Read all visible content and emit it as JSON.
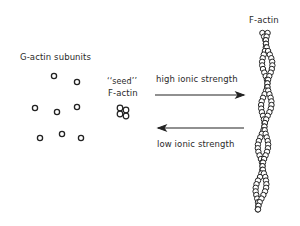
{
  "labels": {
    "g_actin": "G-actin subunits",
    "seed_line1": "‘‘seed’’",
    "seed_line2": "F-actin",
    "f_actin": "F-actin",
    "high_ionic": "high ionic strength",
    "low_ionic": "low ionic strength"
  },
  "arrows": [
    {
      "name": "polymerization-arrow",
      "direction": "right",
      "label": "high ionic strength"
    },
    {
      "name": "depolymerization-arrow",
      "direction": "left",
      "label": "low ionic strength"
    }
  ],
  "g_actin_subunits": [
    {
      "x": 54,
      "y": 76
    },
    {
      "x": 77,
      "y": 82
    },
    {
      "x": 35,
      "y": 108
    },
    {
      "x": 57,
      "y": 112
    },
    {
      "x": 77,
      "y": 107
    },
    {
      "x": 40,
      "y": 138
    },
    {
      "x": 62,
      "y": 134
    },
    {
      "x": 81,
      "y": 138
    }
  ],
  "colors": {
    "stroke": "#222222",
    "background": "#ffffff"
  }
}
